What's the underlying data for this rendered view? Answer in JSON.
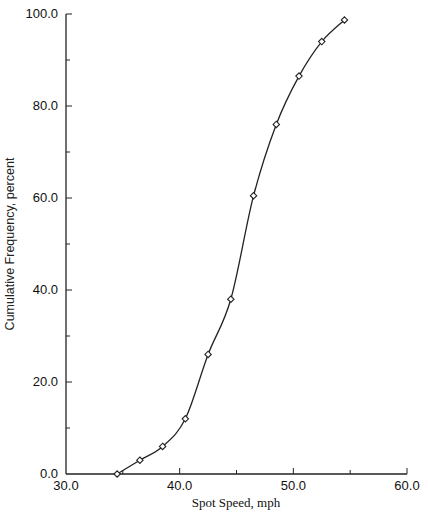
{
  "chart_data": {
    "type": "line",
    "title": "",
    "xlabel": "Spot Speed, mph",
    "ylabel": "Cumulative Frequency, percent",
    "xlim": [
      30,
      60
    ],
    "ylim": [
      0,
      100
    ],
    "x_ticks": [
      "30.0",
      "40.0",
      "50.0",
      "60.0"
    ],
    "y_ticks": [
      "0.0",
      "20.0",
      "40.0",
      "60.0",
      "80.0",
      "100.0"
    ],
    "grid": false,
    "legend": null,
    "marker": "diamond",
    "series": [
      {
        "name": "Cumulative Frequency",
        "x": [
          34.5,
          36.5,
          38.5,
          40.5,
          42.5,
          44.5,
          46.5,
          48.5,
          50.5,
          52.5,
          54.5
        ],
        "y": [
          0.0,
          3.0,
          6.0,
          12.0,
          26.0,
          38.0,
          60.5,
          76.0,
          86.5,
          94.0,
          98.7
        ]
      }
    ]
  }
}
